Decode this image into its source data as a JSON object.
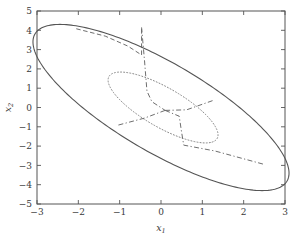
{
  "chart_data": {
    "type": "line",
    "title": "",
    "xlabel": "x1",
    "xlabel_base": "x",
    "xlabel_sub": "1",
    "ylabel": "x2",
    "ylabel_base": "x",
    "ylabel_sub": "2",
    "xlim": [
      -3,
      3
    ],
    "ylim": [
      -5,
      5
    ],
    "xticks": [
      -3,
      -2,
      -1,
      0,
      1,
      2,
      3
    ],
    "xticklabels": [
      "−3",
      "−2",
      "−1",
      "0",
      "1",
      "2",
      "3"
    ],
    "yticks": [
      -5,
      -4,
      -3,
      -2,
      -1,
      0,
      1,
      2,
      3,
      4,
      5
    ],
    "yticklabels": [
      "−5",
      "−4",
      "−3",
      "−2",
      "−1",
      "0",
      "1",
      "2",
      "3",
      "4",
      "5"
    ],
    "grid": false,
    "legend": null,
    "colors": {
      "outer_ellipse": "#555555",
      "inner_ellipse": "#888888",
      "partition": "#666666",
      "axis": "#555555",
      "text": "#3a3a3a",
      "background": "#ffffff"
    },
    "series": [
      {
        "name": "outer-confidence-ellipse",
        "style": "solid",
        "linewidth": 1.1,
        "shape": "ellipse",
        "center": [
          0.0,
          0.0
        ],
        "semi_major": 5.05,
        "semi_minor": 1.62,
        "rotation_deg": -56.5,
        "description": "Large solid tilted ellipse spanning about x1 -2.9..2.9 and x2 -4.2..4.2"
      },
      {
        "name": "inner-confidence-ellipse",
        "style": "dotted",
        "linewidth": 1.0,
        "shape": "ellipse",
        "center": [
          0.05,
          0.0
        ],
        "semi_major": 2.15,
        "semi_minor": 0.72,
        "rotation_deg": -56.5,
        "description": "Smaller dotted tilted ellipse spanning about x1 -1.2..1.3 and x2 -1.8..1.8"
      }
    ],
    "partition_edges": [
      {
        "name": "edge-upper",
        "style": "dashdot",
        "points": [
          [
            -0.47,
            4.15
          ],
          [
            -0.4,
            2.45
          ],
          [
            -0.34,
            0.85
          ],
          [
            -0.22,
            0.3
          ],
          [
            0.1,
            -0.15
          ]
        ]
      },
      {
        "name": "edge-lower-left",
        "style": "dashdot",
        "points": [
          [
            0.1,
            -0.15
          ],
          [
            -0.4,
            -0.55
          ],
          [
            -1.05,
            -0.92
          ]
        ]
      },
      {
        "name": "edge-lower-right",
        "style": "dashdot",
        "points": [
          [
            0.1,
            -0.15
          ],
          [
            0.44,
            -0.45
          ],
          [
            0.5,
            -1.3
          ],
          [
            0.55,
            -1.95
          ],
          [
            1.3,
            -2.25
          ],
          [
            2.5,
            -2.95
          ]
        ]
      },
      {
        "name": "edge-right",
        "style": "dashdot",
        "points": [
          [
            0.1,
            -0.15
          ],
          [
            0.62,
            -0.12
          ],
          [
            1.28,
            0.38
          ]
        ]
      },
      {
        "name": "edge-upper-left-boundary",
        "style": "dashed",
        "points": [
          [
            -2.05,
            4.08
          ],
          [
            -1.35,
            3.7
          ],
          [
            -0.8,
            3.18
          ],
          [
            -0.47,
            2.72
          ],
          [
            -0.47,
            4.15
          ]
        ]
      }
    ],
    "annotations": []
  },
  "figure": {
    "plot_area": {
      "left_px": 37,
      "right_px": 285,
      "top_px": 11,
      "bottom_px": 204
    },
    "frame_visible": true,
    "tick_direction": "in"
  }
}
